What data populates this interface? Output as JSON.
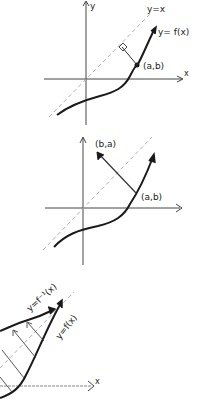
{
  "colors": {
    "ink": "#1a1a1a",
    "axis": "#444444",
    "dashed": "#b0b0b0",
    "background": "#ffffff"
  },
  "panels": [
    {
      "id": "panel-1",
      "title": "Point on f and perpendicular to y=x",
      "labels": {
        "y_axis": "y",
        "x_axis": "x",
        "diagonal": "y=x",
        "curve": "y= f(x)",
        "point": "(a,b)"
      }
    },
    {
      "id": "panel-2",
      "title": "Reflection of (a,b) across y=x",
      "labels": {
        "point": "(a,b)",
        "reflected_point": "(b,a)"
      }
    },
    {
      "id": "panel-3",
      "title": "Graph of f and its inverse",
      "labels": {
        "inverse_curve": "y=f⁻¹(x)",
        "curve": "y=f(x)",
        "x_axis": "x"
      }
    }
  ]
}
